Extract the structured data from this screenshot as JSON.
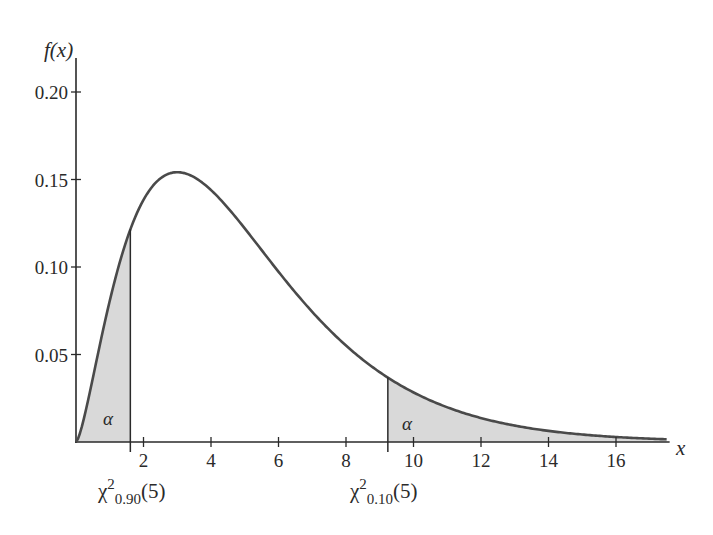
{
  "chart_data": {
    "type": "area",
    "title": "",
    "subtitle": "",
    "distribution": "chi-square",
    "degrees_of_freedom": 5,
    "xlabel": "x",
    "ylabel": "f(x)",
    "xlim": [
      0,
      17.5
    ],
    "ylim": [
      0,
      0.22
    ],
    "grid": false,
    "legend": null,
    "x_ticks": [
      2,
      4,
      6,
      8,
      10,
      12,
      14,
      16
    ],
    "x_tick_labels": [
      "2",
      "4",
      "6",
      "8",
      "10",
      "12",
      "14",
      "16"
    ],
    "y_ticks": [
      0.05,
      0.1,
      0.15,
      0.2
    ],
    "y_tick_labels": [
      "0.05",
      "0.10",
      "0.15",
      "0.20"
    ],
    "curve": {
      "x": [
        0,
        0.5,
        1,
        1.5,
        2,
        2.5,
        3,
        3.5,
        4,
        5,
        6,
        7,
        8,
        9,
        10,
        11,
        12,
        13,
        14,
        15,
        16,
        17
      ],
      "y": [
        0,
        0.037,
        0.08,
        0.114,
        0.138,
        0.15,
        0.154,
        0.152,
        0.144,
        0.122,
        0.097,
        0.074,
        0.055,
        0.04,
        0.028,
        0.02,
        0.014,
        0.009,
        0.006,
        0.004,
        0.003,
        0.002
      ],
      "peak": {
        "x": 3,
        "y": 0.154
      }
    },
    "shaded_regions": [
      {
        "name": "lower-tail",
        "from": 0,
        "to": 1.61,
        "label": "α",
        "boundary_value_f": 0.118
      },
      {
        "name": "upper-tail",
        "from": 9.24,
        "to": 17.5,
        "label": "α",
        "boundary_value_f": 0.034
      }
    ],
    "annotations": [
      {
        "text": "χ²0.90(5)",
        "x": 1.61,
        "base": "χ",
        "sup": "2",
        "sub": "0.90",
        "arg": "(5)"
      },
      {
        "text": "χ²0.10(5)",
        "x": 9.24,
        "base": "χ",
        "sup": "2",
        "sub": "0.10",
        "arg": "(5)"
      }
    ],
    "colors": {
      "curve": "#4a4a4a",
      "shade": "#d9d9d9",
      "axis": "#2a2a2a"
    }
  },
  "labels": {
    "y_axis": "f(x)",
    "x_axis": "x",
    "alpha_left": "α",
    "alpha_right": "α",
    "crit_left": {
      "base": "χ",
      "sup": "2",
      "sub": "0.90",
      "arg": "(5)"
    },
    "crit_right": {
      "base": "χ",
      "sup": "2",
      "sub": "0.10",
      "arg": "(5)"
    }
  }
}
